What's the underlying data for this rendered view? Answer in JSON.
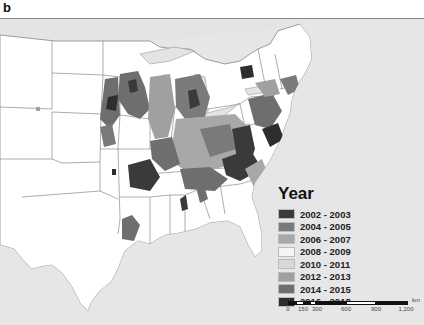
{
  "figure": {
    "panel_label": "b"
  },
  "map": {
    "region": "Eastern and Central United States (county-level)",
    "background_color": "#e6e6e6",
    "land_color": "#ffffff",
    "border_color": "#777777"
  },
  "legend": {
    "title": "Year",
    "items": [
      {
        "label": "2002 - 2003",
        "color": "#3a3a3a"
      },
      {
        "label": "2004 - 2005",
        "color": "#7a7a7a"
      },
      {
        "label": "2006 - 2007",
        "color": "#a8a8a8"
      },
      {
        "label": "2008 - 2009",
        "color": "#f4f4f4"
      },
      {
        "label": "2010 - 2011",
        "color": "#d8d8d8"
      },
      {
        "label": "2012 - 2013",
        "color": "#a0a0a0"
      },
      {
        "label": "2014 - 2015",
        "color": "#6e6e6e"
      },
      {
        "label": "2016 - 2018",
        "color": "#2e2e2e"
      }
    ]
  },
  "scalebar": {
    "unit": "km",
    "ticks": [
      "0",
      "150",
      "300",
      "600",
      "900",
      "1,200"
    ]
  }
}
